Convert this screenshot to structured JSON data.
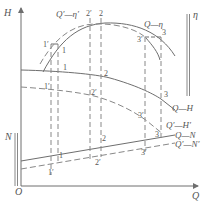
{
  "diagram": {
    "axes": {
      "x_label": "Q",
      "y_label": "H",
      "origin_label": "O",
      "eta_label": "η",
      "n_label": "N"
    },
    "curves": {
      "q_eta": "Q—η",
      "q_eta_prime": "Q′—η′",
      "q_h": "Q—H",
      "q_h_prime": "Q′—H′",
      "q_n": "Q—N",
      "q_n_prime": "Q′—N′"
    },
    "points": {
      "p1": "1",
      "p1p": "1′",
      "p2": "2",
      "p2p": "2′",
      "p3": "3",
      "p3p": "3′"
    }
  },
  "colors": {
    "line": "#6e6e6e",
    "text": "#555555"
  }
}
